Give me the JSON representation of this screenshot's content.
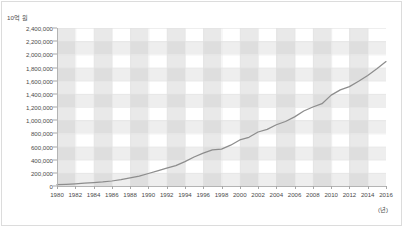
{
  "chart_data": {
    "type": "line",
    "title": "",
    "subtitle": "",
    "xlabel": "(년)",
    "ylabel": "10억 원",
    "ylim": [
      0,
      2400000
    ],
    "xlim": [
      1980,
      2016
    ],
    "grid": true,
    "legend_position": "none",
    "y_ticks": [
      "2,400,000",
      "2,200,000",
      "2,000,000",
      "1,800,000",
      "1,600,000",
      "1,400,000",
      "1,200,000",
      "1,000,000",
      "800,000",
      "600,000",
      "400,000",
      "200,000",
      "0"
    ],
    "y_tick_values": [
      2400000,
      2200000,
      2000000,
      1800000,
      1600000,
      1400000,
      1200000,
      1000000,
      800000,
      600000,
      400000,
      200000,
      0
    ],
    "x_ticks": [
      "1980",
      "1982",
      "1984",
      "1986",
      "1988",
      "1990",
      "1992",
      "1994",
      "1996",
      "1998",
      "2000",
      "2002",
      "2004",
      "2006",
      "2008",
      "2010",
      "2012",
      "2014",
      "2016"
    ],
    "x_tick_values": [
      1980,
      1982,
      1984,
      1986,
      1988,
      1990,
      1992,
      1994,
      1996,
      1998,
      2000,
      2002,
      2004,
      2006,
      2008,
      2010,
      2012,
      2014,
      2016
    ],
    "series": [
      {
        "name": "국내총생산",
        "color": "#8d8d8d",
        "x": [
          1980,
          1981,
          1982,
          1983,
          1984,
          1985,
          1986,
          1987,
          1988,
          1989,
          1990,
          1991,
          1992,
          1993,
          1994,
          1995,
          1996,
          1997,
          1998,
          1999,
          2000,
          2001,
          2002,
          2003,
          2004,
          2005,
          2006,
          2007,
          2008,
          2009,
          2010,
          2011,
          2012,
          2013,
          2014,
          2015,
          2016
        ],
        "values": [
          20000,
          26000,
          33000,
          42000,
          52000,
          62000,
          76000,
          96000,
          125000,
          150000,
          190000,
          230000,
          270000,
          310000,
          370000,
          440000,
          500000,
          550000,
          560000,
          620000,
          700000,
          740000,
          820000,
          860000,
          930000,
          980000,
          1050000,
          1140000,
          1200000,
          1250000,
          1380000,
          1460000,
          1510000,
          1590000,
          1680000,
          1780000,
          1890000
        ]
      }
    ],
    "background": {
      "band_color_vertical": "#c8c8c8",
      "band_color_horizontal": "#c8c8c8",
      "plot_background": "#ffffff",
      "axis_color": "#b4b4b4"
    }
  }
}
